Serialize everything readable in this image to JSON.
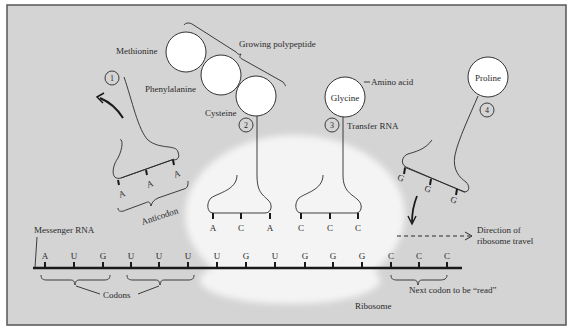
{
  "colors": {
    "background": "#d4d4d4",
    "frame": "#555555",
    "ribosome": "#f4f4f4",
    "amino_acid_fill": "#ffffff",
    "ink": "#2a2a2a"
  },
  "labels": {
    "growing_polypeptide": "Growing polypeptide",
    "amino_acid": "Amino acid",
    "transfer_rna": "Transfer RNA",
    "anticodon": "Anticodon",
    "messenger_rna": "Messenger RNA",
    "codons": "Codons",
    "ribosome": "Ribosome",
    "direction_line1": "Direction of",
    "direction_line2": "ribosome travel",
    "next_codon": "Next codon to be “read”"
  },
  "amino_acids": {
    "methionine": "Methionine",
    "phenylalanine": "Phenylalanine",
    "cysteine": "Cysteine",
    "glycine": "Glycine",
    "proline": "Proline"
  },
  "trna": [
    {
      "number": "1",
      "anticodon": [
        "A",
        "A",
        "A"
      ]
    },
    {
      "number": "2",
      "anticodon": [
        "A",
        "C",
        "A"
      ]
    },
    {
      "number": "3",
      "anticodon": [
        "C",
        "C",
        "C"
      ]
    },
    {
      "number": "4",
      "anticodon": [
        "G",
        "G",
        "G"
      ]
    }
  ],
  "mrna": {
    "bases": [
      "A",
      "U",
      "G",
      "U",
      "U",
      "U",
      "U",
      "G",
      "U",
      "G",
      "G",
      "G",
      "C",
      "C",
      "C"
    ]
  }
}
